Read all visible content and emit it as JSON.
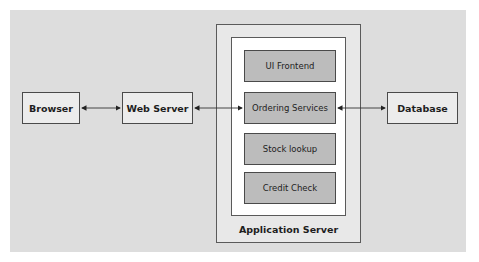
{
  "diagram": {
    "nodes": {
      "browser": "Browser",
      "web_server": "Web Server",
      "database": "Database"
    },
    "application_server": {
      "label": "Application Server",
      "components": [
        "UI Frontend",
        "Ordering Services",
        "Stock lookup",
        "Credit Check"
      ]
    },
    "edges": [
      {
        "from": "Browser",
        "to": "Web Server",
        "type": "bidirectional"
      },
      {
        "from": "Web Server",
        "to": "Ordering Services",
        "type": "bidirectional"
      },
      {
        "from": "Ordering Services",
        "to": "Database",
        "type": "bidirectional"
      }
    ]
  },
  "colors": {
    "background": "#dddddd",
    "node_fill": "#ececec",
    "component_fill": "#bcbcbc",
    "border": "#4a4a4a"
  }
}
